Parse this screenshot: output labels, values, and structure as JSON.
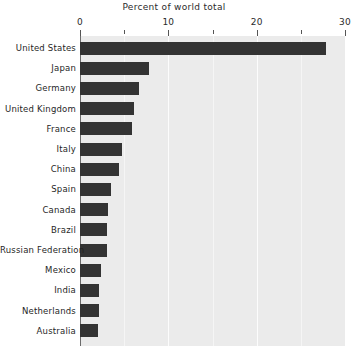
{
  "chart_data": {
    "type": "bar",
    "orientation": "horizontal",
    "title": "Percent of world total",
    "xlabel": "",
    "ylabel": "",
    "xlim": [
      0,
      30
    ],
    "xticks": [
      0,
      10,
      20,
      30
    ],
    "xtick_labels": [
      "0",
      "10",
      "20",
      "30"
    ],
    "xticks_minor": [
      5,
      15,
      25
    ],
    "grid": true,
    "legend": null,
    "categories": [
      "United States",
      "Japan",
      "Germany",
      "United Kingdom",
      "France",
      "Italy",
      "China",
      "Spain",
      "Canada",
      "Brazil",
      "Russian Federation",
      "Mexico",
      "India",
      "Netherlands",
      "Australia"
    ],
    "values": [
      27.9,
      7.8,
      6.7,
      6.1,
      5.9,
      4.7,
      4.4,
      3.5,
      3.2,
      3.1,
      3.0,
      2.4,
      2.2,
      2.1,
      2.0
    ],
    "bar_color": "#333333",
    "plot_background": "#ebebeb",
    "gridline_color": "#ffffff",
    "axis_color": "#6b6b6b"
  },
  "layout": {
    "plot_left": 80,
    "plot_right": 345,
    "plot_top": 36,
    "plot_bottom": 346,
    "row_pitch": 20.2,
    "bar_height": 13,
    "first_row_center": 48
  }
}
